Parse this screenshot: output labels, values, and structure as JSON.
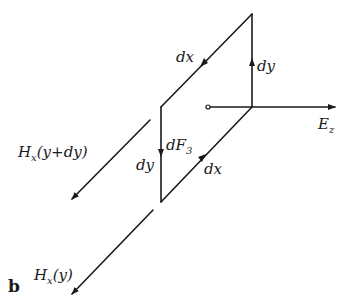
{
  "figure": {
    "panel_label": "b",
    "stroke_color": "#1a1a1a",
    "background": "#ffffff",
    "labels": {
      "dx_top": "dx",
      "dy_right": "dy",
      "ez_main": "E",
      "ez_sub": "z",
      "hx_upper": "H",
      "hx_upper_sub": "x",
      "hx_upper_arg": "(y+dy)",
      "df_main": "dF",
      "df_sub": "3",
      "dy_left": "dy",
      "dx_bottom": "dx",
      "hx_lower": "H",
      "hx_lower_sub": "x",
      "hx_lower_arg": "(y)"
    },
    "elements": [
      "parallelogram current loop with edges dx, dy",
      "arrow E_z along horizontal axis",
      "arrow H_x(y+dy)",
      "arrow H_x(y)",
      "dF_3 label at left edge"
    ]
  }
}
